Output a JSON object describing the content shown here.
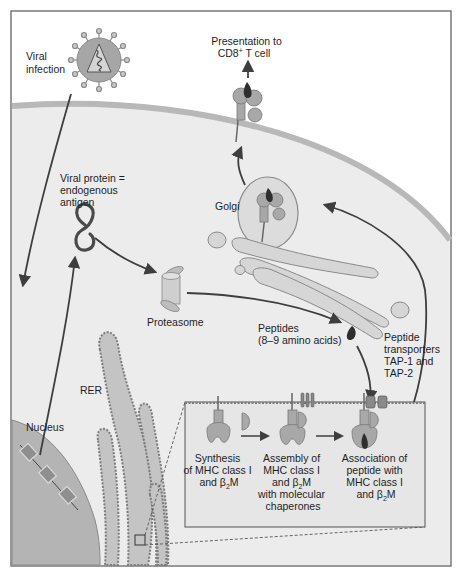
{
  "figure": {
    "colors": {
      "frame": "#6e6e6e",
      "cell_fill": "#ececec",
      "membrane": "#b8b8b8",
      "nucleus": "#b4b4b4",
      "organelle_fill": "#d6d6d6",
      "organelle_stroke": "#8a8a8a",
      "arrow": "#3e3e3e",
      "peptide": "#2e2e2e",
      "inset_fill": "#e6e6e6",
      "rer_dots": "#7c7c7c"
    }
  },
  "labels": {
    "viral_infection": [
      "Viral",
      "infection"
    ],
    "presentation": [
      "Presentation to",
      "CD8",
      "+",
      " T cell"
    ],
    "viral_protein": [
      "Viral protein =",
      "endogenous",
      "antigen"
    ],
    "golgi": "Golgi",
    "proteasome": "Proteasome",
    "peptides": [
      "Peptides",
      "(8–9 amino acids)"
    ],
    "tap": [
      "Peptide",
      "transporters",
      "TAP-1 and",
      "TAP-2"
    ],
    "rer": "RER",
    "nucleus": "Nucleus"
  },
  "inset": {
    "steps": [
      {
        "lines": [
          "Synthesis",
          "of MHC class I",
          "and β",
          "2",
          "M"
        ]
      },
      {
        "lines": [
          "Assembly of",
          "MHC class I",
          "and β",
          "2",
          "M",
          "with molecular",
          "chaperones"
        ]
      },
      {
        "lines": [
          "Association of",
          "peptide with",
          "MHC class I",
          "and β",
          "2",
          "M"
        ]
      }
    ]
  }
}
